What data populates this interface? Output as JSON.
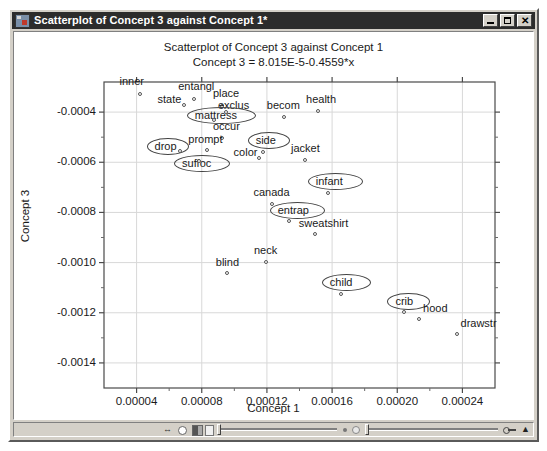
{
  "window": {
    "title": "Scatterplot of Concept 3 against Concept 1*",
    "icon": "statistica-window-icon",
    "buttons": {
      "minimize": "minimize-button",
      "maximize": "maximize-button",
      "close": "✕"
    }
  },
  "statusbar": {
    "icons": [
      "undo-arrows-icon",
      "circle-icon",
      "half-filled-square-icon",
      "light-square-icon",
      "key-icon",
      "chevron-up-icon"
    ]
  },
  "chart_data": {
    "type": "scatter",
    "title": "Scatterplot of Concept 3 against Concept 1",
    "subtitle": "Concept 3 = 8.015E-5-0.4559*x",
    "xlabel": "Concept 1",
    "ylabel": "Concept 3",
    "xlim": [
      2e-05,
      0.00026
    ],
    "ylim": [
      -0.0015,
      -0.00028
    ],
    "xticks": [
      "0.00004",
      "0.00008",
      "0.00012",
      "0.00016",
      "0.00020",
      "0.00024"
    ],
    "xtick_values": [
      4e-05,
      8e-05,
      0.00012,
      0.00016,
      0.0002,
      0.00024
    ],
    "yticks": [
      "-0.0004",
      "-0.0006",
      "-0.0008",
      "-0.0010",
      "-0.0012",
      "-0.0014"
    ],
    "ytick_values": [
      -0.0004,
      -0.0006,
      -0.0008,
      -0.001,
      -0.0012,
      -0.0014
    ],
    "grid": true,
    "legend": "none",
    "marker": "open-circle",
    "points": [
      {
        "label": "inner",
        "x": 4.3e-05,
        "y": -0.00033,
        "lx": -22,
        "ly": -15,
        "circled": false
      },
      {
        "label": "entangl",
        "x": 7.6e-05,
        "y": -0.00035,
        "lx": -17,
        "ly": -15,
        "circled": false
      },
      {
        "label": "state",
        "x": 7e-05,
        "y": -0.000375,
        "lx": -28,
        "ly": -8,
        "circled": false
      },
      {
        "label": "place",
        "x": 9.3e-05,
        "y": -0.00038,
        "lx": -10,
        "ly": -15,
        "circled": false
      },
      {
        "label": "exclus",
        "x": 9.55e-05,
        "y": -0.000405,
        "lx": -9,
        "ly": -9,
        "circled": false
      },
      {
        "label": "mattress",
        "x": 8.8e-05,
        "y": -0.000437,
        "lx": -20,
        "ly": -7,
        "circled": true
      },
      {
        "label": "occur",
        "x": 9.3e-05,
        "y": -0.000508,
        "lx": -10,
        "ly": -14,
        "circled": false
      },
      {
        "label": "prompt",
        "x": 8.4e-05,
        "y": -0.000555,
        "lx": -20,
        "ly": -13,
        "circled": false
      },
      {
        "label": "drop",
        "x": 6.7e-05,
        "y": -0.000558,
        "lx": -26,
        "ly": -7,
        "circled": true
      },
      {
        "label": "suffoc",
        "x": 7.9e-05,
        "y": -0.0006,
        "lx": -18,
        "ly": 0,
        "circled": true
      },
      {
        "label": "becom",
        "x": 0.000131,
        "y": -0.000425,
        "lx": -18,
        "ly": -14,
        "circled": false
      },
      {
        "label": "health",
        "x": 0.000152,
        "y": -0.0004,
        "lx": -13,
        "ly": -14,
        "circled": false
      },
      {
        "label": "side",
        "x": 0.000118,
        "y": -0.000565,
        "lx": -8,
        "ly": -14,
        "circled": true
      },
      {
        "label": "color",
        "x": 0.0001155,
        "y": -0.000588,
        "lx": -26,
        "ly": -8,
        "circled": false
      },
      {
        "label": "jacket",
        "x": 0.000144,
        "y": -0.000595,
        "lx": -15,
        "ly": -14,
        "circled": false
      },
      {
        "label": "infant",
        "x": 0.000158,
        "y": -0.000728,
        "lx": -13,
        "ly": -14,
        "circled": true
      },
      {
        "label": "canada",
        "x": 0.000124,
        "y": -0.00077,
        "lx": -20,
        "ly": -14,
        "circled": false
      },
      {
        "label": "entrap",
        "x": 0.000134,
        "y": -0.00084,
        "lx": -12,
        "ly": -13,
        "circled": true
      },
      {
        "label": "sweatshirt",
        "x": 0.00015,
        "y": -0.00089,
        "lx": -17,
        "ly": -13,
        "circled": false
      },
      {
        "label": "neck",
        "x": 0.00012,
        "y": -0.001,
        "lx": -13,
        "ly": -14,
        "circled": false
      },
      {
        "label": "blind",
        "x": 9.6e-05,
        "y": -0.001045,
        "lx": -12,
        "ly": -13,
        "circled": false
      },
      {
        "label": "child",
        "x": 0.000166,
        "y": -0.00113,
        "lx": -12,
        "ly": -14,
        "circled": true
      },
      {
        "label": "crib",
        "x": 0.000205,
        "y": -0.0012,
        "lx": -10,
        "ly": -13,
        "circled": true
      },
      {
        "label": "hood",
        "x": 0.000214,
        "y": -0.001228,
        "lx": 3,
        "ly": -13,
        "circled": false
      },
      {
        "label": "drawstr",
        "x": 0.000237,
        "y": -0.00129,
        "lx": 3,
        "ly": -13,
        "circled": false
      }
    ]
  }
}
